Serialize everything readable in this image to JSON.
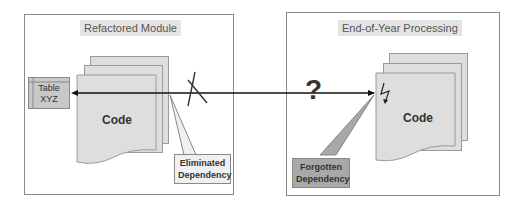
{
  "left_module": {
    "title": "Refactored Module",
    "table_label_line1": "Table",
    "table_label_line2": "XYZ",
    "code_label": "Code",
    "callout_line1": "Eliminated",
    "callout_line2": "Dependency"
  },
  "right_module": {
    "title": "End-of-Year Processing",
    "code_label": "Code",
    "callout_line1": "Forgotten",
    "callout_line2": "Dependency"
  },
  "connector": {
    "question_mark": "?",
    "cross_mark": "X",
    "lightning_icon": "lightning-bolt"
  },
  "colors": {
    "frame_border": "#8a8a8a",
    "page_fill": "#dedede",
    "table_fill": "#c8c8c8",
    "eliminated_callout_fill": "#f0f0f0",
    "forgotten_callout_fill": "#a8a8a8",
    "arrow": "#111111"
  }
}
